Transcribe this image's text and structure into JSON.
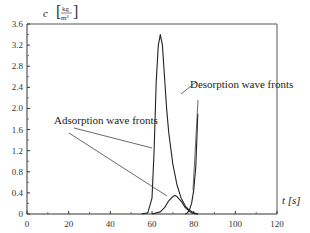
{
  "chart_data": {
    "type": "line",
    "title": "",
    "xlabel": "t [s]",
    "ylabel": "c [kg/m³]",
    "xlim": [
      0,
      120
    ],
    "ylim": [
      0,
      3.6
    ],
    "x_ticks": [
      "0",
      "20",
      "40",
      "60",
      "80",
      "100",
      "120"
    ],
    "y_ticks": [
      "0",
      "0.4",
      "0.8",
      "1.2",
      "1.6",
      "2.0",
      "2.4",
      "2.8",
      "3.2",
      "3.6"
    ],
    "grid": false,
    "series": [
      {
        "name": "Large peak",
        "x": [
          55,
          58,
          60,
          61,
          62,
          63,
          64,
          65,
          66,
          67,
          68,
          70,
          72,
          74,
          76,
          78,
          80,
          82
        ],
        "y": [
          0.0,
          0.02,
          0.3,
          1.2,
          2.5,
          3.2,
          3.4,
          3.2,
          2.6,
          2.0,
          1.55,
          0.95,
          0.55,
          0.3,
          0.15,
          0.07,
          0.02,
          0.0
        ]
      },
      {
        "name": "Small peak",
        "x": [
          60,
          64,
          66,
          68,
          70,
          71,
          72,
          74,
          76,
          78,
          80,
          82
        ],
        "y": [
          0.0,
          0.04,
          0.12,
          0.25,
          0.33,
          0.35,
          0.33,
          0.24,
          0.12,
          0.05,
          0.01,
          0.0
        ]
      },
      {
        "name": "Steep front",
        "x": [
          76,
          77,
          78,
          79,
          80,
          81,
          82
        ],
        "y": [
          0.0,
          0.02,
          0.08,
          0.2,
          0.45,
          0.9,
          1.9
        ]
      }
    ],
    "annotations": [
      {
        "text": "Adsorption wave fronts",
        "position": [
          20,
          1.9
        ]
      },
      {
        "text": "Desorption wave fronts",
        "position": [
          83,
          2.4
        ]
      }
    ]
  },
  "labels": {
    "y_axis_symbol": "c",
    "y_unit_num": "kg",
    "y_unit_den": "m³",
    "x_axis": "t [s]",
    "adsorption": "Adsorption wave fronts",
    "desorption": "Desorption wave fronts"
  }
}
